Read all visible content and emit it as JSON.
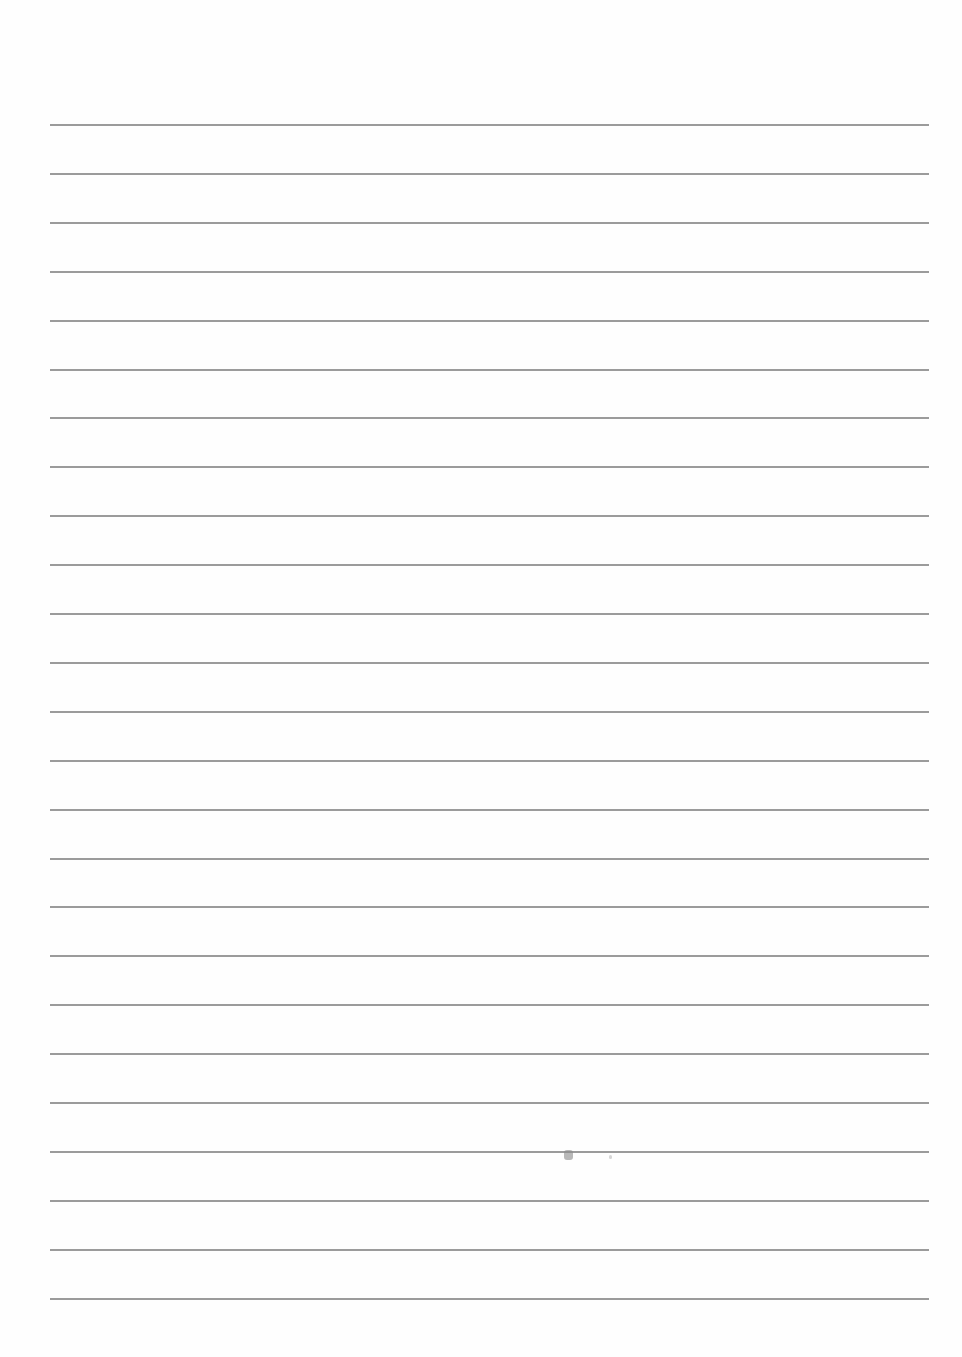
{
  "document": {
    "type": "ruled-paper",
    "line_count": 25,
    "first_line_y": 124,
    "line_spacing": 48.9,
    "line_left": 50,
    "line_right": 929,
    "line_color": "#8a8a8a",
    "background": "#fefefe"
  }
}
